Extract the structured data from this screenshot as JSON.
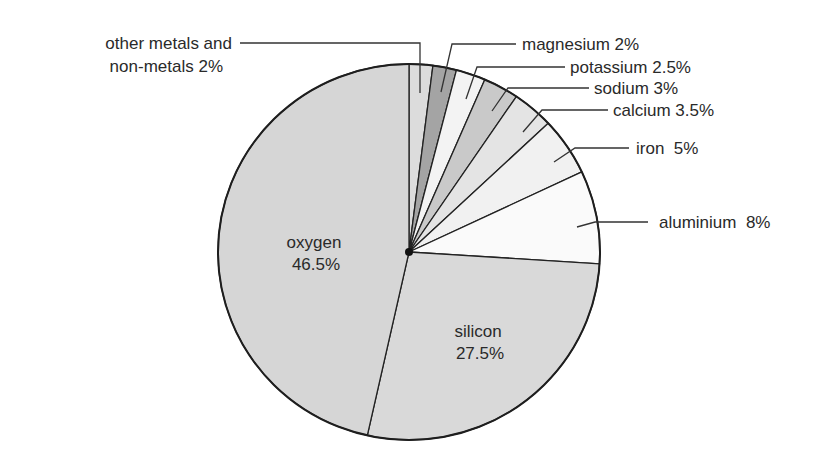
{
  "chart_data": {
    "type": "pie",
    "title": "",
    "start_angle_deg_from_top": 0,
    "direction": "clockwise",
    "unit": "%",
    "slices": [
      {
        "name": "other metals and non-metals",
        "value": 2,
        "label": "other metals and\nnon-metals 2%",
        "label_lines": [
          "other metals and",
          "non-metals 2%"
        ],
        "color": "#dcdcdc"
      },
      {
        "name": "magnesium",
        "value": 2,
        "label": "magnesium 2%",
        "label_lines": [
          "magnesium 2%"
        ],
        "color": "#a4a4a4"
      },
      {
        "name": "potassium",
        "value": 2.5,
        "label": "potassium 2.5%",
        "label_lines": [
          "potassium 2.5%"
        ],
        "color": "#f3f3f3"
      },
      {
        "name": "sodium",
        "value": 3,
        "label": "sodium 3%",
        "label_lines": [
          "sodium 3%"
        ],
        "color": "#c9c9c9"
      },
      {
        "name": "calcium",
        "value": 3.5,
        "label": "calcium 3.5%",
        "label_lines": [
          "calcium 3.5%"
        ],
        "color": "#e4e4e4"
      },
      {
        "name": "iron",
        "value": 5,
        "label": "iron  5%",
        "label_lines": [
          "iron  5%"
        ],
        "color": "#f1f1f1"
      },
      {
        "name": "aluminium",
        "value": 8,
        "label": "aluminium  8%",
        "label_lines": [
          "aluminium  8%"
        ],
        "color": "#fafafa"
      },
      {
        "name": "silicon",
        "value": 27.5,
        "label": "silicon\n27.5%",
        "label_lines": [
          "silicon",
          "27.5%"
        ],
        "color": "#d9d9d9"
      },
      {
        "name": "oxygen",
        "value": 46.5,
        "label": "oxygen\n46.5%",
        "label_lines": [
          "oxygen",
          "46.5%"
        ],
        "color": "#d6d6d6"
      }
    ],
    "legend": "none (leader-line labels)",
    "stroke_color": "#222222"
  },
  "geometry": {
    "cx": 409,
    "cy": 252,
    "rx": 191,
    "ry": 188
  },
  "labels": {
    "other": {
      "line1": "other metals and",
      "line2": "non-metals 2%"
    },
    "magnesium": "magnesium 2%",
    "potassium": "potassium 2.5%",
    "sodium": "sodium 3%",
    "calcium": "calcium 3.5%",
    "iron": "iron  5%",
    "aluminium": "aluminium  8%",
    "oxygen": {
      "line1": "oxygen",
      "line2": "46.5%"
    },
    "silicon": {
      "line1": "silicon",
      "line2": "27.5%"
    }
  }
}
